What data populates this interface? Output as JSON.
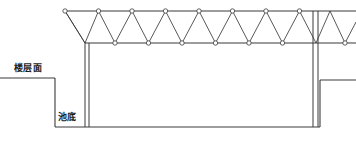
{
  "drawing": {
    "width": 356,
    "height": 147,
    "background_color": "#ffffff",
    "line_color": "#3a3a3a",
    "node_fill_color": "#ffffff",
    "text_color": "#1a1a1a",
    "labels": {
      "floor_level": "楼层面",
      "pool_bottom": "池底"
    },
    "truss": {
      "type": "warren-truss-with-verticals",
      "top_chord_y": 11,
      "bottom_chord_y": 43,
      "top_chord_x_start": 65,
      "top_chord_x_end": 356,
      "bottom_chord_x_start": 85,
      "bottom_chord_x_end": 356,
      "node_radius": 2.2,
      "panel_width": 33.5,
      "top_nodes_x": [
        65,
        98.5,
        132,
        165.5,
        199,
        232.5,
        266,
        299.5
      ],
      "bottom_nodes_x": [
        85,
        115,
        148.5,
        182,
        215.5,
        249,
        282.5,
        316,
        345
      ],
      "node_count_top": 8,
      "node_count_bottom": 9
    },
    "columns": {
      "left": {
        "x_outer": 85,
        "x_inner": 89,
        "y_top": 43,
        "y_bottom": 127
      },
      "right": {
        "x_outer": 313,
        "x_inner": 318,
        "y_top": 11,
        "y_bottom": 127
      }
    },
    "ground": {
      "floor_left_y": 78,
      "floor_left_x_start": 0,
      "floor_left_x_end": 55,
      "floor_left_drop_y": 127,
      "pool_bottom_y": 127,
      "pool_bottom_x_start": 55,
      "pool_bottom_x_end": 320,
      "floor_right_y": 80,
      "floor_right_x_start": 320,
      "floor_right_x_end": 356
    }
  }
}
